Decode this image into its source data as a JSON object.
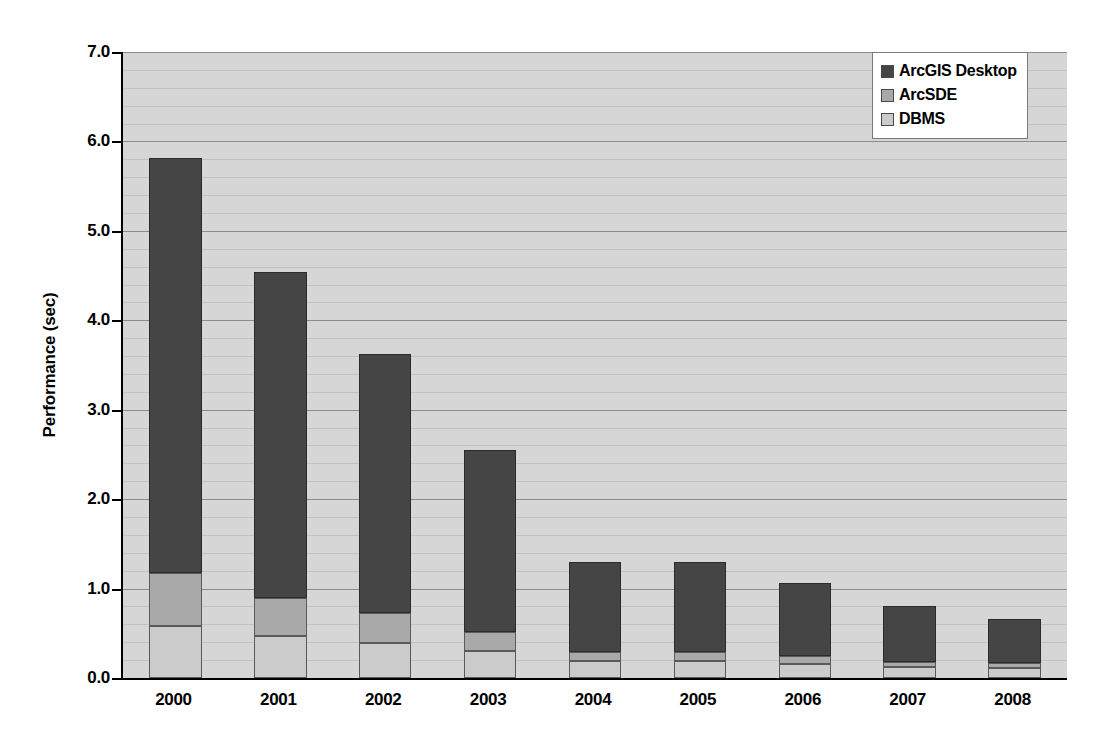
{
  "chart_data": {
    "type": "bar",
    "subtype": "stacked-vertical",
    "title": "",
    "xlabel": "",
    "ylabel": "Performance (sec)",
    "ylim": [
      0.0,
      7.0
    ],
    "ytick_step": 1.0,
    "yticks": [
      "0.0",
      "1.0",
      "2.0",
      "3.0",
      "4.0",
      "5.0",
      "6.0",
      "7.0"
    ],
    "ytick_values": [
      0.0,
      1.0,
      2.0,
      3.0,
      4.0,
      5.0,
      6.0,
      7.0
    ],
    "grid": true,
    "grid_minor_step": 0.2,
    "legend_position": "top-right",
    "categories": [
      "2000",
      "2001",
      "2002",
      "2003",
      "2004",
      "2005",
      "2006",
      "2007",
      "2008"
    ],
    "series": [
      {
        "name": "DBMS",
        "color": "#cbcbcb",
        "values": [
          0.58,
          0.47,
          0.39,
          0.3,
          0.19,
          0.19,
          0.16,
          0.12,
          0.11
        ]
      },
      {
        "name": "ArcSDE",
        "color": "#a9a9a9",
        "values": [
          0.59,
          0.43,
          0.34,
          0.22,
          0.1,
          0.1,
          0.09,
          0.06,
          0.06
        ]
      },
      {
        "name": "ArcGIS Desktop",
        "color": "#454545",
        "values": [
          4.64,
          3.64,
          2.89,
          2.03,
          1.01,
          1.01,
          0.81,
          0.63,
          0.49
        ]
      }
    ],
    "totals": [
      5.81,
      4.54,
      3.62,
      2.55,
      1.3,
      1.3,
      1.06,
      0.81,
      0.66
    ],
    "stack_order_bottom_to_top": [
      "DBMS",
      "ArcSDE",
      "ArcGIS Desktop"
    ],
    "colors": {
      "plot_background": "#d6d6d6",
      "gridline_major": "#8c8c8c",
      "gridline_minor": "#c2c2c2",
      "axis": "#000000",
      "legend_background": "#ffffff",
      "legend_border": "#7a7a7a"
    }
  },
  "legend": {
    "items": [
      {
        "label": "ArcGIS Desktop",
        "color": "#454545"
      },
      {
        "label": "ArcSDE",
        "color": "#a9a9a9"
      },
      {
        "label": "DBMS",
        "color": "#cbcbcb"
      }
    ]
  }
}
